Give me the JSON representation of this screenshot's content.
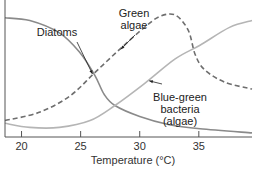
{
  "chart_data": {
    "type": "line",
    "title": "",
    "xlabel": "Temperature (°C)",
    "ylabel": "",
    "xlim": [
      18.6,
      39.5
    ],
    "ylim": [
      0,
      100
    ],
    "grid": false,
    "x_ticks": [
      20,
      25,
      30,
      35
    ],
    "x_tick_labels": [
      "20",
      "25",
      "30",
      "35"
    ],
    "legend": "none (inline annotations)",
    "series": [
      {
        "name": "Diatoms",
        "style": "solid",
        "color": "#8a8a8a",
        "points": [
          [
            18.6,
            87
          ],
          [
            20.7,
            85
          ],
          [
            23.2,
            76
          ],
          [
            24.9,
            62
          ],
          [
            26.2,
            45
          ],
          [
            27.0,
            31
          ],
          [
            27.9,
            23
          ],
          [
            30.0,
            15
          ],
          [
            32.5,
            9
          ],
          [
            35.1,
            6
          ],
          [
            39.5,
            3
          ]
        ]
      },
      {
        "name": "Green algae",
        "style": "dashed",
        "color": "#6e6e6e",
        "points": [
          [
            18.6,
            12
          ],
          [
            21.5,
            18
          ],
          [
            24.1,
            30
          ],
          [
            26.2,
            47
          ],
          [
            28.3,
            64
          ],
          [
            30.4,
            80
          ],
          [
            31.7,
            88
          ],
          [
            33.0,
            89
          ],
          [
            34.1,
            78
          ],
          [
            34.7,
            60
          ],
          [
            35.5,
            49
          ],
          [
            37.2,
            40
          ],
          [
            39.5,
            35
          ]
        ]
      },
      {
        "name": "Blue-green bacteria (algae)",
        "style": "solid",
        "color": "#b5b5b5",
        "points": [
          [
            18.6,
            10
          ],
          [
            20.7,
            7
          ],
          [
            23.2,
            7
          ],
          [
            25.8,
            12
          ],
          [
            27.9,
            23
          ],
          [
            30.4,
            39
          ],
          [
            33.0,
            57
          ],
          [
            35.1,
            67
          ],
          [
            37.6,
            80
          ],
          [
            39.5,
            85
          ]
        ]
      }
    ],
    "annotations": [
      {
        "lines": [
          "Diatoms"
        ],
        "points_to": "Diatoms",
        "target": [
          26.0,
          46
        ]
      },
      {
        "lines": [
          "Green",
          "algae"
        ],
        "points_to": "Green algae",
        "target": [
          28.4,
          64
        ]
      },
      {
        "lines": [
          "Blue-green",
          "bacteria",
          "(algae)"
        ],
        "points_to": "Blue-green bacteria (algae)",
        "target": [
          30.8,
          41
        ]
      }
    ]
  }
}
